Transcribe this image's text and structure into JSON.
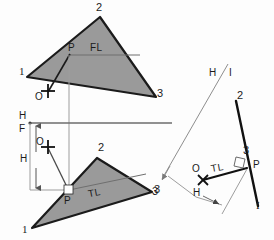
{
  "drawing": {
    "title": "Descriptive geometry: true length and point view construction",
    "colors": {
      "background": "#fdfdfd",
      "plane_fill": "#9a9a9a",
      "plane_stroke": "#1b1b1b",
      "heavy_line": "#111111",
      "thin_line": "#8e8e8e",
      "text": "#1b1b1b"
    },
    "top_view": {
      "vertices": {
        "v1": {
          "label": "1",
          "x": 27,
          "y": 77
        },
        "v2": {
          "label": "2",
          "x": 100,
          "y": 17
        },
        "v3": {
          "label": "3",
          "x": 156,
          "y": 97
        }
      },
      "point_label": "P",
      "line_tag": "FL",
      "aux_point_label": "O"
    },
    "front_view": {
      "vertices": {
        "v1": {
          "label": "1",
          "x": 32,
          "y": 228
        },
        "v2": {
          "label": "2",
          "x": 97,
          "y": 158
        },
        "v3": {
          "label": "3",
          "x": 152,
          "y": 192
        }
      },
      "point_label": "P",
      "line_tag": "TL",
      "aux_point_label": "O"
    },
    "fold_line": {
      "upper_label": "H",
      "lower_label": "F"
    },
    "dimension": {
      "label": "H"
    },
    "auxiliary_view": {
      "fold_label_left": "H",
      "fold_label_right": "I",
      "fold_separator": "/",
      "vertex_2_label": "2",
      "vertex_3_label": "3",
      "vertex_1_label": "I",
      "edge_point_label": "P",
      "aux_point_label": "O",
      "true_length_tag": "TL",
      "dimension_label": "H",
      "arrow_target_label": "3"
    }
  }
}
